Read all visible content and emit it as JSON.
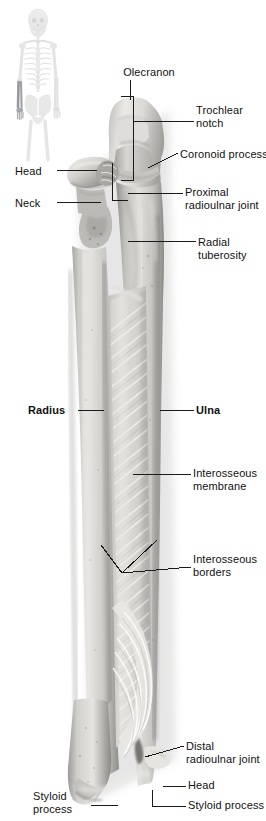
{
  "figure": {
    "view": "anterior",
    "inset": {
      "name": "whole-body-skeleton-inset",
      "highlight_region": "left forearm (radius and ulna)",
      "highlight_color": "#8f9296",
      "skeleton_color": "#e8e9ea"
    },
    "colors": {
      "bone_light": "#e9e8e6",
      "bone_mid": "#b9b7b4",
      "bone_dark": "#7d7b79",
      "membrane": "#d6d5d2",
      "leader_line": "#1a1a1a",
      "text": "#111111",
      "background": "#ffffff"
    }
  },
  "labels": [
    {
      "id": "olecranon",
      "text": "Olecranon",
      "bold": false,
      "align": "center",
      "x": 113,
      "y": 66,
      "w": 72
    },
    {
      "id": "trochlear-notch",
      "text": "Trochlear\nnotch",
      "bold": false,
      "align": "left",
      "x": 196,
      "y": 104,
      "w": 70
    },
    {
      "id": "coronoid-process",
      "text": "Coronoid process",
      "bold": false,
      "align": "left",
      "x": 180,
      "y": 148,
      "w": 86
    },
    {
      "id": "head-proximal",
      "text": "Head",
      "bold": false,
      "align": "left",
      "x": 15,
      "y": 165,
      "w": 40
    },
    {
      "id": "proximal-radioulnar-joint",
      "text": "Proximal\nradioulnar joint",
      "bold": false,
      "align": "left",
      "x": 185,
      "y": 186,
      "w": 82
    },
    {
      "id": "neck",
      "text": "Neck",
      "bold": false,
      "align": "left",
      "x": 15,
      "y": 197,
      "w": 40
    },
    {
      "id": "radial-tuberosity",
      "text": "Radial\ntuberosity",
      "bold": false,
      "align": "left",
      "x": 198,
      "y": 236,
      "w": 66
    },
    {
      "id": "radius",
      "text": "Radius",
      "bold": true,
      "align": "left",
      "x": 28,
      "y": 404,
      "w": 48
    },
    {
      "id": "ulna",
      "text": "Ulna",
      "bold": true,
      "align": "left",
      "x": 196,
      "y": 404,
      "w": 40
    },
    {
      "id": "interosseous-membrane",
      "text": "Interosseous\nmembrane",
      "bold": false,
      "align": "left",
      "x": 193,
      "y": 467,
      "w": 72
    },
    {
      "id": "interosseous-borders",
      "text": "Interosseous\nborders",
      "bold": false,
      "align": "left",
      "x": 193,
      "y": 553,
      "w": 72
    },
    {
      "id": "distal-radioulnar-joint",
      "text": "Distal\nradioulnar joint",
      "bold": false,
      "align": "left",
      "x": 186,
      "y": 740,
      "w": 80
    },
    {
      "id": "head-distal",
      "text": "Head",
      "bold": false,
      "align": "left",
      "x": 188,
      "y": 779,
      "w": 44
    },
    {
      "id": "styloid-process-ulna",
      "text": "Styloid process",
      "bold": false,
      "align": "left",
      "x": 188,
      "y": 799,
      "w": 78
    },
    {
      "id": "styloid-process-radius",
      "text": "Styloid\nprocess",
      "bold": false,
      "align": "left",
      "x": 33,
      "y": 790,
      "w": 56
    }
  ],
  "leaders": [
    {
      "id": "leader-olecranon",
      "type": "line",
      "points": "130,80 130,100"
    },
    {
      "id": "leader-trochlear-notch",
      "type": "bracket",
      "points": "121,96 133,96 133,180 121,180",
      "tail": "133,121 194,121"
    },
    {
      "id": "leader-coronoid-process",
      "type": "line",
      "points": "148,168 178,153"
    },
    {
      "id": "leader-head-proximal",
      "type": "line",
      "points": "57,170 97,170"
    },
    {
      "id": "leader-proximal-radioulnar-joint",
      "type": "bracket",
      "points": "112,163 112,200 128,200",
      "tail": "128,193 183,193"
    },
    {
      "id": "leader-neck",
      "type": "line",
      "points": "57,202 101,202"
    },
    {
      "id": "leader-radial-tuberosity",
      "type": "line",
      "points": "128,241 196,241"
    },
    {
      "id": "leader-radius",
      "type": "line",
      "points": "78,410 104,410"
    },
    {
      "id": "leader-ulna",
      "type": "line",
      "points": "160,410 194,410"
    },
    {
      "id": "leader-interosseous-membrane",
      "type": "line",
      "points": "133,474 191,474"
    },
    {
      "id": "leader-interosseous-borders",
      "type": "fork",
      "points": "101,545 122,573 157,540",
      "tail": "122,573 191,567"
    },
    {
      "id": "leader-distal-radioulnar-joint",
      "type": "line",
      "points": "145,757 184,746"
    },
    {
      "id": "leader-head-distal",
      "type": "line",
      "points": "163,786 186,786"
    },
    {
      "id": "leader-styloid-process-ulna",
      "type": "line",
      "points": "152,790 152,806 186,806"
    },
    {
      "id": "leader-styloid-process-radius",
      "type": "line",
      "points": "91,805 118,805"
    }
  ]
}
